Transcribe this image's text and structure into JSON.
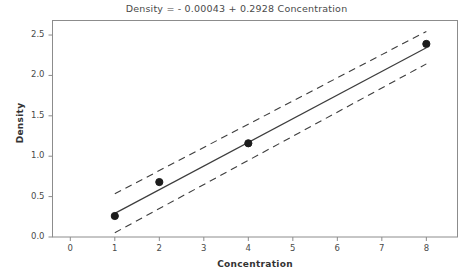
{
  "chart_data": {
    "type": "scatter",
    "title": "Density =  - 0.00043 + 0.2928 Concentration",
    "xlabel": "Concentration",
    "ylabel": "Density",
    "xlim": [
      -0.4,
      8.7
    ],
    "ylim": [
      0.0,
      2.68
    ],
    "grid": false,
    "legend": null,
    "xticks": [
      "0",
      "1",
      "2",
      "3",
      "4",
      "5",
      "6",
      "7",
      "8"
    ],
    "xtick_values": [
      0,
      1,
      2,
      3,
      4,
      5,
      6,
      7,
      8
    ],
    "yticks": [
      "0.0",
      "0.5",
      "1.0",
      "1.5",
      "2.0",
      "2.5"
    ],
    "ytick_values": [
      0.0,
      0.5,
      1.0,
      1.5,
      2.0,
      2.5
    ],
    "points": [
      {
        "x": 1,
        "y": 0.26
      },
      {
        "x": 2,
        "y": 0.68
      },
      {
        "x": 4,
        "y": 1.16
      },
      {
        "x": 8,
        "y": 2.39
      }
    ],
    "fit_line": {
      "name": "Regression fit",
      "intercept": -0.00043,
      "slope": 0.2928,
      "x": [
        1,
        8
      ],
      "y": [
        0.2924,
        2.342
      ],
      "style": "solid"
    },
    "confidence_bands": [
      {
        "name": "Upper confidence limit",
        "style": "dashed",
        "x": [
          1,
          8
        ],
        "y": [
          0.535,
          2.545
        ]
      },
      {
        "name": "Lower confidence limit",
        "style": "dashed",
        "x": [
          1,
          8
        ],
        "y": [
          0.053,
          2.143
        ]
      }
    ],
    "colors": {
      "fit_line": "#3d3d3d",
      "confidence_band": "#3d3d3d",
      "marker": "#1c1c1c",
      "axis": "#8c8c8c",
      "background": "#ffffff"
    }
  }
}
